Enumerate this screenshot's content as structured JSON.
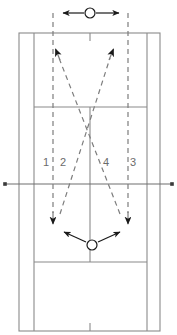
{
  "diagram": {
    "court": {
      "outer_left": 19,
      "outer_right": 160,
      "outer_top": 33,
      "outer_bottom": 331,
      "singles_left": 34,
      "singles_right": 147,
      "service_line_top": 107,
      "service_line_bottom": 262,
      "center_x": 90,
      "net_y": 184,
      "net_left_end": 5,
      "net_right_end": 172,
      "line_color": "#8a8a8a",
      "net_color": "#6e6e6e"
    },
    "route_labels": [
      {
        "text": "1",
        "x": 46,
        "y": 166
      },
      {
        "text": "2",
        "x": 63,
        "y": 166
      },
      {
        "text": "4",
        "x": 106,
        "y": 166
      },
      {
        "text": "3",
        "x": 133,
        "y": 166
      }
    ],
    "dashed_color": "#7d7d7d",
    "solid_arrow_color": "#1a1a1a",
    "players": [
      {
        "name": "top-player",
        "cx": 90,
        "cy": 13,
        "r": 5
      },
      {
        "name": "bottom-player",
        "cx": 92,
        "cy": 245,
        "r": 5
      }
    ],
    "vertical_guides": [
      {
        "name": "guide-left",
        "x": 53,
        "y1": 13,
        "y2": 222
      },
      {
        "name": "guide-right",
        "x": 128,
        "y1": 13,
        "y2": 222
      }
    ],
    "top_movement": {
      "left_arrow_tip_x": 62,
      "right_arrow_tip_x": 120,
      "y": 13
    },
    "diagonals": [
      {
        "name": "diagonal-to-upper-left",
        "x1": 120,
        "y1": 216,
        "x2": 56,
        "y2": 51
      },
      {
        "name": "diagonal-to-upper-right",
        "x1": 60,
        "y1": 216,
        "x2": 113,
        "y2": 51
      }
    ],
    "bottom_movement": [
      {
        "name": "bottom-arrow-left",
        "x1": 86,
        "y1": 242,
        "x2": 62,
        "y2": 231
      },
      {
        "name": "bottom-arrow-right",
        "x1": 98,
        "y1": 242,
        "x2": 122,
        "y2": 231
      }
    ]
  }
}
